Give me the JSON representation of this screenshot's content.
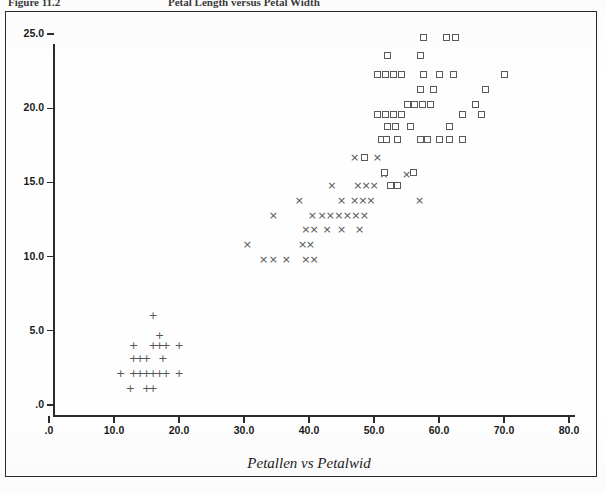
{
  "header": {
    "figure_number": "Figure 11.2",
    "figure_heading": "Petal Length versus Petal Width"
  },
  "caption": "Petallen vs Petalwid",
  "colors": {
    "frame": "#2a2a2a",
    "axis": "#2b2b2b",
    "marker": "#555555",
    "background": "#ffffff"
  },
  "chart_data": {
    "type": "scatter",
    "title": "Petallen vs Petalwid",
    "xlabel": "",
    "ylabel": "",
    "xlim": [
      0,
      80
    ],
    "ylim": [
      0,
      25
    ],
    "grid": false,
    "legend": "none",
    "xticks": [
      0,
      10,
      20,
      30,
      40,
      50,
      60,
      70,
      80
    ],
    "xticklabels": [
      ".0",
      "10.0",
      "20.0",
      "30.0",
      "40.0",
      "50.0",
      "60.0",
      "70.0",
      "80.0"
    ],
    "yticks": [
      0,
      5,
      10,
      15,
      20,
      25
    ],
    "yticklabels": [
      ".0",
      "5.0",
      "10.0",
      "15.0",
      "20.0",
      "25.0"
    ],
    "series": [
      {
        "name": "group-plus",
        "marker": "plus",
        "glyph": "+",
        "points": [
          [
            16,
            6.0
          ],
          [
            17,
            4.7
          ],
          [
            13,
            4.0
          ],
          [
            16,
            4.0
          ],
          [
            17,
            4.0
          ],
          [
            18,
            4.0
          ],
          [
            20,
            4.0
          ],
          [
            13,
            3.1
          ],
          [
            14,
            3.1
          ],
          [
            15,
            3.1
          ],
          [
            17.5,
            3.1
          ],
          [
            11,
            2.1
          ],
          [
            13,
            2.1
          ],
          [
            14,
            2.1
          ],
          [
            15,
            2.1
          ],
          [
            16,
            2.1
          ],
          [
            17,
            2.1
          ],
          [
            18,
            2.1
          ],
          [
            20,
            2.1
          ],
          [
            12.5,
            1.1
          ],
          [
            15,
            1.1
          ],
          [
            16,
            1.1
          ]
        ]
      },
      {
        "name": "group-cross",
        "marker": "cross",
        "glyph": "×",
        "points": [
          [
            47,
            16.7
          ],
          [
            50.5,
            16.7
          ],
          [
            43.5,
            14.8
          ],
          [
            47.5,
            14.8
          ],
          [
            48.8,
            14.8
          ],
          [
            50,
            14.8
          ],
          [
            51.5,
            15.5
          ],
          [
            55,
            15.5
          ],
          [
            38.5,
            13.8
          ],
          [
            45,
            13.8
          ],
          [
            47,
            13.8
          ],
          [
            48.3,
            13.8
          ],
          [
            49.5,
            13.8
          ],
          [
            34.5,
            12.8
          ],
          [
            40.5,
            12.8
          ],
          [
            42,
            12.8
          ],
          [
            43.3,
            12.8
          ],
          [
            44.6,
            12.8
          ],
          [
            45.9,
            12.8
          ],
          [
            47.2,
            12.8
          ],
          [
            48.5,
            12.8
          ],
          [
            39.5,
            11.8
          ],
          [
            40.8,
            11.8
          ],
          [
            42.8,
            11.8
          ],
          [
            45,
            11.8
          ],
          [
            47.8,
            11.8
          ],
          [
            30.5,
            10.8
          ],
          [
            39,
            10.8
          ],
          [
            40.2,
            10.8
          ],
          [
            33,
            9.8
          ],
          [
            34.5,
            9.8
          ],
          [
            36.5,
            9.8
          ],
          [
            39.5,
            9.8
          ],
          [
            40.8,
            9.8
          ],
          [
            57,
            13.8
          ]
        ]
      },
      {
        "name": "group-square",
        "marker": "square",
        "points": [
          [
            57.5,
            24.8
          ],
          [
            61,
            24.8
          ],
          [
            62.5,
            24.8
          ],
          [
            52,
            23.6
          ],
          [
            57,
            23.6
          ],
          [
            50.5,
            22.3
          ],
          [
            51.7,
            22.3
          ],
          [
            52.9,
            22.3
          ],
          [
            54.1,
            22.3
          ],
          [
            57.5,
            22.3
          ],
          [
            60,
            22.3
          ],
          [
            62.2,
            22.3
          ],
          [
            70,
            22.3
          ],
          [
            57,
            21.3
          ],
          [
            59,
            21.3
          ],
          [
            67,
            21.3
          ],
          [
            55,
            20.3
          ],
          [
            56.2,
            20.3
          ],
          [
            57.4,
            20.3
          ],
          [
            58.6,
            20.3
          ],
          [
            65.5,
            20.3
          ],
          [
            50.5,
            19.6
          ],
          [
            51.7,
            19.6
          ],
          [
            52.9,
            19.6
          ],
          [
            54.1,
            19.6
          ],
          [
            63.5,
            19.6
          ],
          [
            66.5,
            19.6
          ],
          [
            52,
            18.8
          ],
          [
            53.2,
            18.8
          ],
          [
            55.5,
            18.8
          ],
          [
            61.5,
            18.8
          ],
          [
            51,
            17.9
          ],
          [
            51.9,
            17.9
          ],
          [
            53.5,
            17.9
          ],
          [
            57,
            17.9
          ],
          [
            58.2,
            17.9
          ],
          [
            60,
            17.9
          ],
          [
            61.5,
            17.9
          ],
          [
            63.5,
            17.9
          ],
          [
            48.5,
            16.7
          ],
          [
            51.5,
            15.7
          ],
          [
            56,
            15.7
          ],
          [
            52.5,
            14.8
          ],
          [
            53.5,
            14.8
          ]
        ]
      }
    ]
  }
}
